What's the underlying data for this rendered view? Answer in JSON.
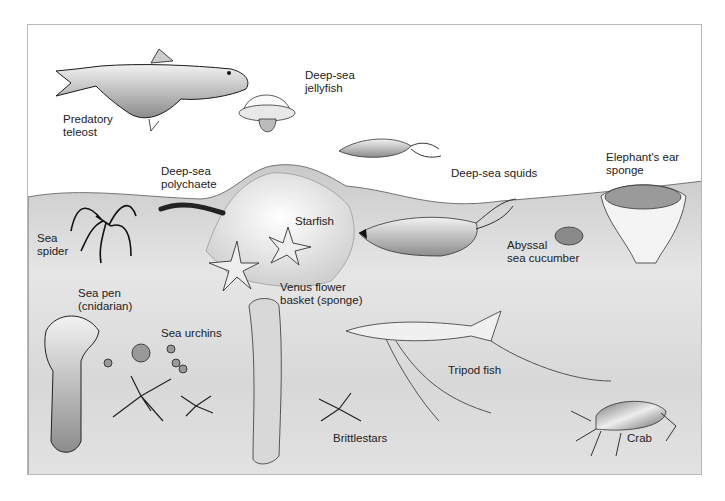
{
  "figure": {
    "labels": {
      "predatory_teleost": "Predatory\nteleost",
      "deep_sea_jellyfish": "Deep-sea\njellyfish",
      "deep_sea_squids": "Deep-sea squids",
      "elephants_ear_sponge": "Elephant's ear\nsponge",
      "deep_sea_polychaete": "Deep-sea\npolychaete",
      "sea_spider": "Sea\nspider",
      "starfish": "Starfish",
      "abyssal_sea_cucumber": "Abyssal\nsea cucumber",
      "sea_pen": "Sea pen\n(cnidarian)",
      "venus_flower_basket": "Venus flower\nbasket (sponge)",
      "sea_urchins": "Sea urchins",
      "tripod_fish": "Tripod fish",
      "brittlestars": "Brittlestars",
      "crab": "Crab"
    },
    "colors": {
      "seafloor_light": "#f4f4f4",
      "seafloor_dark": "#c9c9c9",
      "outline": "#1a1a1a",
      "frame_border": "#b8b8b8"
    }
  }
}
